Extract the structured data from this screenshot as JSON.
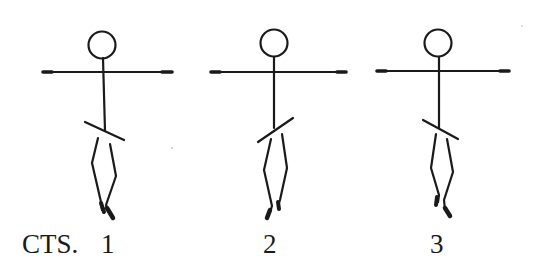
{
  "diagram": {
    "type": "dance-notation-stick-figures",
    "ink_color": "#1a1a1a",
    "background": "#ffffff",
    "counts_label": "CTS.",
    "figures": [
      {
        "count": "1",
        "hip_tilt": "down-right",
        "feet": "crossed, right foot forward"
      },
      {
        "count": "2",
        "hip_tilt": "up-right",
        "feet": "crossed, left foot forward"
      },
      {
        "count": "3",
        "hip_tilt": "down-right",
        "feet": "crossed, right foot forward"
      }
    ]
  }
}
